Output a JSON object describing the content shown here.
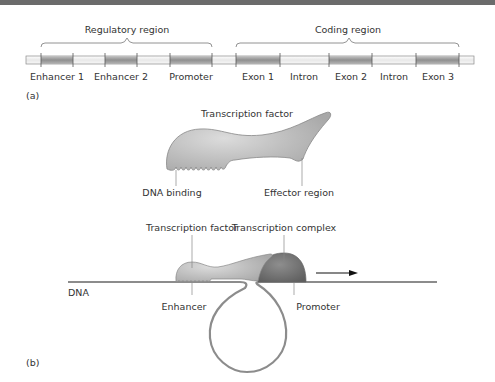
{
  "figure": {
    "panel_a": {
      "label": "(a)",
      "regions": [
        {
          "name": "Regulatory region"
        },
        {
          "name": "Coding region"
        }
      ],
      "segments": [
        {
          "label": "Enhancer 1"
        },
        {
          "label": "Enhancer 2"
        },
        {
          "label": "Promoter"
        },
        {
          "label": "Exon 1"
        },
        {
          "label": "Intron"
        },
        {
          "label": "Exon 2"
        },
        {
          "label": "Intron"
        },
        {
          "label": "Exon 3"
        }
      ]
    },
    "transcription_factor": {
      "title": "Transcription factor",
      "dna_binding": "DNA binding",
      "effector_region": "Effector region"
    },
    "panel_b": {
      "label": "(b)",
      "transcription_factor": "Transcription factor",
      "transcription_complex": "Transcription complex",
      "dna": "DNA",
      "enhancer": "Enhancer",
      "promoter": "Promoter"
    },
    "colors": {
      "segment_dark": "#9e9e9e",
      "segment_light": "#eeeeee",
      "protein_light": "#c8c8c8",
      "complex_dark": "#7a7a7a",
      "dna_line": "#8c8c8c",
      "top_bar": "#6b6b6b"
    }
  }
}
